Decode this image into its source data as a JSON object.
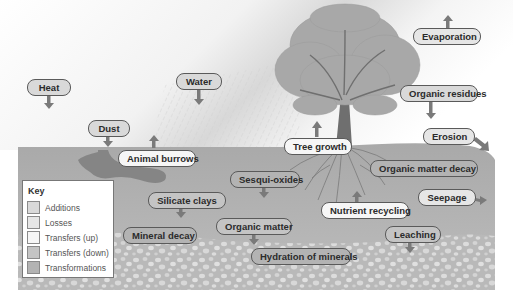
{
  "diagram": {
    "colors": {
      "additions": "#d9d9d9",
      "losses": "#e6e6e6",
      "transfers_up": "#f6f6f6",
      "transfers_down": "#c4c4c4",
      "transformations": "#b3b3b3",
      "soil": "#b8b8b8",
      "arrow": "#7a7a7a"
    }
  },
  "key": {
    "title": "Key",
    "items": [
      {
        "label": "Additions",
        "color": "#d9d9d9"
      },
      {
        "label": "Losses",
        "color": "#e6e6e6"
      },
      {
        "label": "Transfers (up)",
        "color": "#f6f6f6"
      },
      {
        "label": "Transfers (down)",
        "color": "#c4c4c4"
      },
      {
        "label": "Transformations",
        "color": "#b3b3b3"
      }
    ]
  },
  "labels": {
    "heat": "Heat",
    "water": "Water",
    "dust": "Dust",
    "animal_burrows": "Animal burrows",
    "evaporation": "Evaporation",
    "organic_residues": "Organic residues",
    "erosion": "Erosion",
    "tree_growth": "Tree growth",
    "organic_matter_decay": "Organic matter decay",
    "sesqui_oxides": "Sesqui-oxides",
    "silicate_clays": "Silicate clays",
    "mineral_decay": "Mineral decay",
    "organic_matter": "Organic matter",
    "nutrient_recycling": "Nutrient recycling",
    "seepage": "Seepage",
    "leaching": "Leaching",
    "hydration_of_minerals": "Hydration of minerals"
  }
}
